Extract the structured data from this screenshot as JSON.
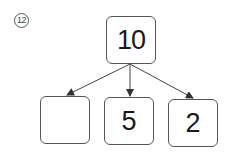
{
  "problem": {
    "number_label": "12"
  },
  "diagram": {
    "type": "number-decomposition-tree",
    "root": {
      "value": "10"
    },
    "children": [
      {
        "value": ""
      },
      {
        "value": "5"
      },
      {
        "value": "2"
      }
    ],
    "colors": {
      "stroke": "#555555",
      "text": "#1a1a1a"
    }
  }
}
